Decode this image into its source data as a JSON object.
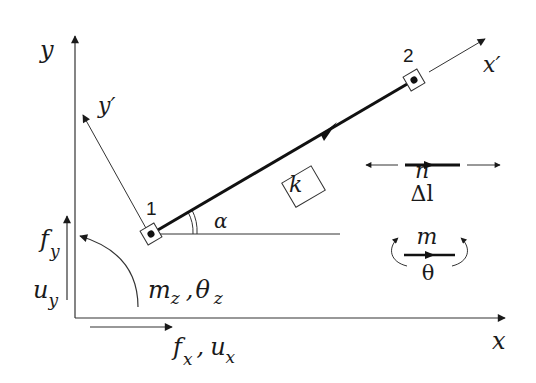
{
  "diagram": {
    "type": "2D truss/frame element in global and local coordinates",
    "axes": {
      "global_x": "x",
      "global_y": "y",
      "local_x": "x′",
      "local_y": "y′"
    },
    "nodes": [
      {
        "id": "1",
        "label": "1"
      },
      {
        "id": "2",
        "label": "2"
      }
    ],
    "element": {
      "label": "k"
    },
    "angle": {
      "label": "α"
    },
    "dofs": {
      "fy": "f",
      "fy_sub": "y",
      "uy": "u",
      "uy_sub": "y",
      "fx": "f",
      "fx_sub": "x",
      "ux": "u",
      "ux_sub": "x",
      "mz": "m",
      "mz_sub": "z",
      "thetaz": "θ",
      "thetaz_sub": "z",
      "comma": ","
    },
    "legend": {
      "axial_force": "n",
      "axial_elongation": "Δl",
      "moment": "m",
      "rotation": "θ"
    },
    "colors": {
      "ink": "#1a1a1a",
      "background": "#ffffff"
    }
  }
}
